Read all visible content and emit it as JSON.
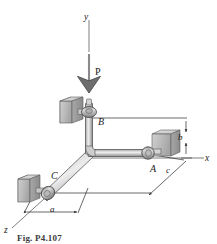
{
  "figure": {
    "caption": "Fig. P4.107"
  },
  "axes": {
    "y_label": "y",
    "x_label": "x",
    "z_label": "z"
  },
  "load": {
    "label": "P",
    "direction": "downward"
  },
  "joints": [
    {
      "id": "A",
      "label": "A"
    },
    {
      "id": "B",
      "label": "B"
    },
    {
      "id": "C",
      "label": "C"
    }
  ],
  "dimensions": [
    {
      "id": "a",
      "label": "a",
      "orientation": "diagonal-z"
    },
    {
      "id": "b",
      "label": "b",
      "orientation": "vertical"
    },
    {
      "id": "c",
      "label": "c",
      "orientation": "diagonal-z"
    }
  ],
  "colors": {
    "background": "#ffffff",
    "line": "#2a2a2a",
    "pipe_light": "#e6e6e6",
    "pipe_mid": "#c3c3c3",
    "pipe_dark": "#8f8f8f",
    "block_face": "#bdbdbd",
    "block_top": "#d8d8d8",
    "block_side": "#9a9a9a",
    "text": "#1b1b1b"
  }
}
